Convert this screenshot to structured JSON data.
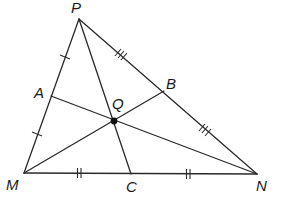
{
  "diagram": {
    "type": "triangle-with-cevians",
    "background": "#ffffff",
    "stroke_color": "#2a2a2a",
    "points": {
      "P": {
        "label": "P",
        "x": 79,
        "y": 19
      },
      "M": {
        "label": "M",
        "x": 24,
        "y": 173
      },
      "N": {
        "label": "N",
        "x": 257,
        "y": 174
      },
      "A": {
        "label": "A",
        "x": 51,
        "y": 96
      },
      "B": {
        "label": "B",
        "x": 164,
        "y": 91
      },
      "C": {
        "label": "C",
        "x": 131,
        "y": 174
      },
      "Q": {
        "label": "Q",
        "x": 114,
        "y": 121
      }
    },
    "labels": {
      "P": "P",
      "M": "M",
      "N": "N",
      "A": "A",
      "B": "B",
      "C": "C",
      "Q": "Q"
    },
    "segments": [
      {
        "from": "P",
        "to": "M",
        "role": "side"
      },
      {
        "from": "M",
        "to": "N",
        "role": "side"
      },
      {
        "from": "N",
        "to": "P",
        "role": "side"
      },
      {
        "from": "A",
        "to": "N",
        "role": "cevian"
      },
      {
        "from": "M",
        "to": "B",
        "role": "cevian"
      },
      {
        "from": "P",
        "to": "C",
        "role": "cevian"
      }
    ],
    "tick_marks": [
      {
        "segment": "PA",
        "count": 1
      },
      {
        "segment": "AM",
        "count": 1
      },
      {
        "segment": "PB",
        "count": 3
      },
      {
        "segment": "BN",
        "count": 3
      },
      {
        "segment": "MC",
        "count": 2
      },
      {
        "segment": "CN",
        "count": 2
      }
    ],
    "intersection_point": "Q"
  }
}
